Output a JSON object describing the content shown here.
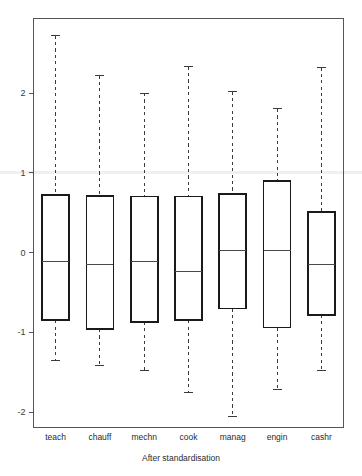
{
  "chart_data": {
    "type": "box",
    "title": "",
    "xlabel": "After standardisation",
    "ylabel": "",
    "categories": [
      "teach",
      "chauff",
      "mechn",
      "cook",
      "manag",
      "engin",
      "cashr"
    ],
    "yticks": [
      2,
      1,
      0,
      -1,
      -2
    ],
    "ytick_labels": [
      "2",
      "1",
      "0",
      "-1",
      "-2"
    ],
    "ylim": [
      -2.6,
      2.85
    ],
    "grid": "faint horizontal reference line at y = 1",
    "gridline_value": 1,
    "legend": "none",
    "boxes": [
      {
        "category": "teach",
        "whisker_low": -1.35,
        "q1": -0.85,
        "median": -0.11,
        "q3": 0.72,
        "whisker_high": 2.72
      },
      {
        "category": "chauff",
        "whisker_low": -1.42,
        "q1": -0.96,
        "median": -0.15,
        "q3": 0.71,
        "whisker_high": 2.22
      },
      {
        "category": "mechn",
        "whisker_low": -1.48,
        "q1": -0.87,
        "median": -0.11,
        "q3": 0.7,
        "whisker_high": 2.0
      },
      {
        "category": "cook",
        "whisker_low": -1.75,
        "q1": -0.85,
        "median": -0.24,
        "q3": 0.7,
        "whisker_high": 2.33
      },
      {
        "category": "manag",
        "whisker_low": -2.06,
        "q1": -0.7,
        "median": 0.02,
        "q3": 0.73,
        "whisker_high": 2.02
      },
      {
        "category": "engin",
        "whisker_low": -1.72,
        "q1": -0.94,
        "median": 0.03,
        "q3": 0.9,
        "whisker_high": 1.8
      },
      {
        "category": "cashr",
        "whisker_low": -1.48,
        "q1": -0.78,
        "median": -0.15,
        "q3": 0.51,
        "whisker_high": 2.32
      }
    ]
  },
  "style": {
    "box_stroke": "#1a1a1a",
    "median_stroke": "#4a4a4a",
    "whisker_stroke": "#3a3a3a",
    "frame_stroke": "#555555",
    "gridline_color": "#f2f0ee",
    "background": "#ffffff"
  }
}
